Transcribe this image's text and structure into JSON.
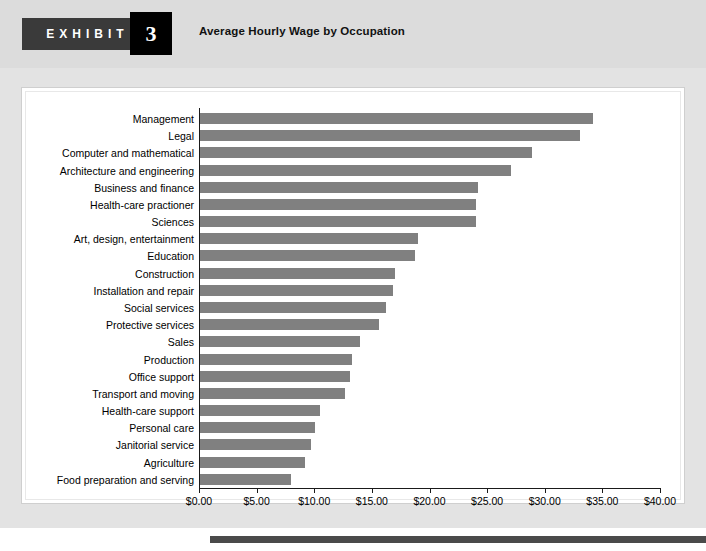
{
  "exhibit": {
    "word": "EXHIBIT",
    "number": "3",
    "title": "Average Hourly Wage by Occupation"
  },
  "colors": {
    "bar": "#808080",
    "plate": "#3a3a3a",
    "number_box": "#000000",
    "page": "#e3e3e3",
    "panel": "#ffffff",
    "axis": "#1a1a1a"
  },
  "chart_data": {
    "type": "bar",
    "orientation": "horizontal",
    "title": "Average Hourly Wage by Occupation",
    "xlabel": "",
    "ylabel": "",
    "xlim": [
      0,
      40
    ],
    "grid": false,
    "legend": null,
    "tick_labels": [
      "$0.00",
      "$5.00",
      "$10.00",
      "$15.00",
      "$20.00",
      "$25.00",
      "$30.00",
      "$35.00",
      "$40.00"
    ],
    "tick_values": [
      0,
      5,
      10,
      15,
      20,
      25,
      30,
      35,
      40
    ],
    "categories": [
      "Management",
      "Legal",
      "Computer and mathematical",
      "Architecture and engineering",
      "Business and finance",
      "Health-care practioner",
      "Sciences",
      "Art, design, entertainment",
      "Education",
      "Construction",
      "Installation and repair",
      "Social services",
      "Protective services",
      "Sales",
      "Production",
      "Office support",
      "Transport and moving",
      "Health-care support",
      "Personal care",
      "Janitorial service",
      "Agriculture",
      "Food preparation and serving"
    ],
    "values": [
      34.2,
      33.1,
      28.9,
      27.1,
      24.2,
      24.0,
      24.0,
      19.0,
      18.7,
      17.0,
      16.8,
      16.2,
      15.6,
      14.0,
      13.3,
      13.1,
      12.7,
      10.5,
      10.1,
      9.7,
      9.2,
      8.0
    ]
  }
}
